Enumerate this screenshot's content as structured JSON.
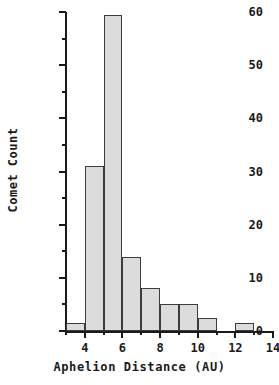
{
  "chart_data": {
    "type": "bar",
    "title": "",
    "subtitle": "",
    "xlabel": "Aphelion Distance (AU)",
    "ylabel": "Comet Count",
    "xlim": [
      3,
      14
    ],
    "ylim": [
      0,
      60
    ],
    "grid": false,
    "legend": null,
    "bin_width": 1,
    "bin_edges": [
      3,
      4,
      5,
      6,
      7,
      8,
      9,
      10,
      11,
      12,
      13
    ],
    "categories": [
      "3-4",
      "4-5",
      "5-6",
      "6-7",
      "7-8",
      "8-9",
      "9-10",
      "10-11",
      "11-12",
      "12-13"
    ],
    "values": [
      1.5,
      31,
      59.5,
      14,
      8,
      5,
      5,
      2.5,
      0,
      1.5
    ],
    "x_major_ticks": [
      4,
      6,
      8,
      10,
      12,
      14
    ],
    "x_major_tick_labels": [
      "4",
      "6",
      "8",
      "10",
      "12",
      "14"
    ],
    "x_minor_ticks": [
      3,
      5,
      7,
      9,
      11,
      13
    ],
    "y_major_ticks": [
      0,
      10,
      20,
      30,
      40,
      50,
      60
    ],
    "y_major_tick_labels": [
      "0",
      "10",
      "20",
      "30",
      "40",
      "50",
      "60"
    ],
    "y_minor_ticks": [
      5,
      15,
      25,
      35,
      45,
      55
    ],
    "bar_fill_color": "#dcdcdc",
    "bar_edge_color": "#3c3c3c",
    "axis_color": "#1a1a1a",
    "background_color": "#ffffff"
  }
}
